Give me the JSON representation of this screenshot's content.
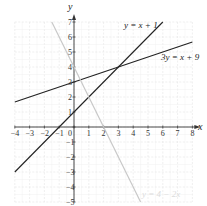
{
  "chart_data": {
    "type": "line",
    "title": "",
    "xlabel": "x",
    "ylabel": "y",
    "xlim": [
      -4,
      8
    ],
    "ylim": [
      -5,
      7
    ],
    "grid": true,
    "x_ticks": [
      "-4",
      "-3",
      "-2",
      "-1",
      "0",
      "1",
      "2",
      "3",
      "4",
      "5",
      "6",
      "7",
      "8"
    ],
    "y_ticks": [
      "7",
      "6",
      "5",
      "4",
      "3",
      "2",
      "1",
      "-1",
      "-2",
      "-3",
      "-4",
      "-5"
    ],
    "series": [
      {
        "name": "y = x + 1",
        "equation": "y = x + 1",
        "x": [
          -4,
          6
        ],
        "y": [
          -3,
          7
        ],
        "color": "#222222"
      },
      {
        "name": "3y = x + 9",
        "equation": "3y = x + 9",
        "x": [
          -4,
          8
        ],
        "y": [
          1.67,
          5.67
        ],
        "color": "#222222"
      },
      {
        "name": "y = 4 − 2x",
        "equation": "y = 4 − 2x",
        "x": [
          -1.5,
          4.5
        ],
        "y": [
          7,
          -5
        ],
        "color": "#c8c8c8"
      }
    ],
    "annotations": [
      {
        "text": "y = x + 1",
        "x": 3.5,
        "y": 6.6
      },
      {
        "text": "3y = x + 9",
        "x": 6.0,
        "y": 4.5
      },
      {
        "text": "y = 4 − 2x",
        "x": 4.5,
        "y": -4.6
      },
      {
        "text": "intersection",
        "x": 3,
        "y": 4
      }
    ]
  },
  "labels": {
    "x_axis": "x",
    "y_axis": "y",
    "eq1": "y = x + 1",
    "eq2": "3y = x + 9",
    "eq3": "y = 4 − 2x"
  }
}
